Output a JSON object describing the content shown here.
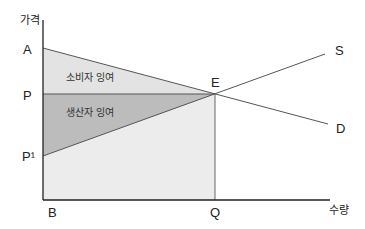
{
  "diagram": {
    "title": "",
    "y_axis_label": "가격",
    "x_axis_label": "수량",
    "points": {
      "A": "A",
      "P": "P",
      "P1": "P¹",
      "B": "B",
      "Q": "Q",
      "E": "E"
    },
    "curves": {
      "supply": "S",
      "demand": "D"
    },
    "areas": {
      "consumer_surplus": "소비자 잉여",
      "producer_surplus": "생산자 잉여"
    },
    "colors": {
      "consumer_surplus_fill": "#e6e6e6",
      "producer_surplus_fill": "#bdbdbd",
      "lower_rect_fill": "#ececec",
      "line": "#555555",
      "axis": "#222222"
    }
  }
}
